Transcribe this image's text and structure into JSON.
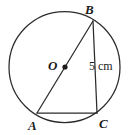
{
  "figure": {
    "background_color": "#ffffff",
    "stroke_color": "#2b2b2b",
    "labels": {
      "center": "O",
      "top_point": "B",
      "bottom_left_point": "A",
      "bottom_right_point": "C",
      "segment_measure": "5 cm"
    },
    "geometry": {
      "circle": {
        "cx": 64.5,
        "cy": 67,
        "r": 55.5
      },
      "center_dot": {
        "cx": 65,
        "cy": 67,
        "r": 2.6
      },
      "points": {
        "B": {
          "x": 93,
          "y": 21
        },
        "A": {
          "x": 37,
          "y": 113
        },
        "C": {
          "x": 97,
          "y": 113
        }
      },
      "segments": [
        {
          "name": "diameter-AB",
          "x1": 37,
          "y1": 113,
          "x2": 93,
          "y2": 21
        },
        {
          "name": "segment-BC",
          "x1": 93,
          "y1": 21,
          "x2": 97,
          "y2": 113
        },
        {
          "name": "chord-AC",
          "x1": 37,
          "y1": 113,
          "x2": 97,
          "y2": 113
        }
      ]
    }
  }
}
